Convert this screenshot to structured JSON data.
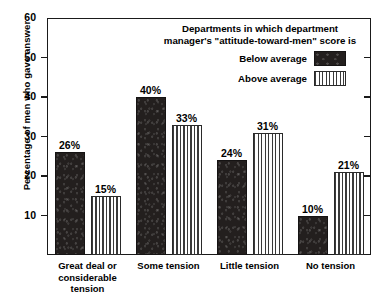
{
  "chart_data": {
    "type": "bar",
    "title": "",
    "xlabel": "",
    "ylabel": "Percentage of men who gave answer",
    "ylim": [
      0,
      60
    ],
    "yticks": [
      10,
      20,
      30,
      40,
      50,
      60
    ],
    "grid": false,
    "legend_position": "top-right-inside",
    "legend_title": "Departments in which department\nmanager's \"attitude-toward-men\" score is",
    "categories": [
      "Great deal or considerable tension",
      "Some tension",
      "Little tension",
      "No tension"
    ],
    "category_label_lines": [
      [
        "Great deal or",
        "considerable",
        "tension"
      ],
      [
        "Some tension"
      ],
      [
        "Little tension"
      ],
      [
        "No tension"
      ]
    ],
    "series": [
      {
        "name": "Below average",
        "pattern": "solid-dark",
        "color": "#231f1e",
        "values": [
          26,
          40,
          24,
          10
        ],
        "value_labels": [
          "26%",
          "40%",
          "24%",
          "10%"
        ]
      },
      {
        "name": "Above average",
        "pattern": "vertical-stripes",
        "color": "#3a3a3a",
        "values": [
          15,
          33,
          31,
          21
        ],
        "value_labels": [
          "15%",
          "33%",
          "31%",
          "21%"
        ]
      }
    ],
    "ytick_labels": [
      "10",
      "20",
      "30",
      "40",
      "50",
      "60"
    ]
  },
  "axis": {
    "y_title": "Percentage of men who gave answer"
  },
  "legend": {
    "title": "Departments in which department\nmanager's \"attitude-toward-men\" score is",
    "items": [
      {
        "label": "Below average"
      },
      {
        "label": "Above average"
      }
    ]
  },
  "colors": {
    "below_average": "#231f1e",
    "above_average": "#3a3a3a",
    "axis": "#1a1a1a",
    "background": "#ffffff"
  }
}
